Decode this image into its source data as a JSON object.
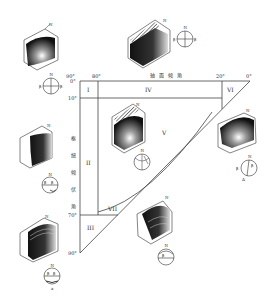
{
  "diagram": {
    "x_axis_title": "轴面倾角",
    "y_axis_title_chars": [
      "枢",
      "纽",
      "倾",
      "伏",
      "角"
    ],
    "x_ticks": [
      {
        "label": "90°",
        "value": 90
      },
      {
        "label": "80°",
        "value": 80
      },
      {
        "label": "20°",
        "value": 20
      },
      {
        "label": "0°",
        "value": 0
      }
    ],
    "y_ticks": [
      {
        "label": "0°",
        "value": 0
      },
      {
        "label": "10°",
        "value": 10
      },
      {
        "label": "70°",
        "value": 70
      },
      {
        "label": "90°",
        "value": 90
      }
    ],
    "regions": [
      {
        "id": "I",
        "label": "I"
      },
      {
        "id": "II",
        "label": "II"
      },
      {
        "id": "III",
        "label": "III"
      },
      {
        "id": "IV",
        "label": "IV"
      },
      {
        "id": "V",
        "label": "V"
      },
      {
        "id": "VI",
        "label": "VI"
      },
      {
        "id": "VII",
        "label": "VII"
      }
    ],
    "fold_blocks": [
      {
        "position": "top-left",
        "north_label": "N",
        "stereonet_labels": [
          "N",
          "β",
          "β"
        ]
      },
      {
        "position": "top-center",
        "north_label": "N",
        "stereonet_labels": [
          "N",
          "β",
          "β"
        ]
      },
      {
        "position": "center-region-V",
        "north_label": "N",
        "stereonet_labels": [
          "N"
        ]
      },
      {
        "position": "middle-left",
        "north_label": "N",
        "stereonet_labels": [
          "N",
          "β",
          "β"
        ]
      },
      {
        "position": "middle-right",
        "north_label": "N",
        "stereonet_labels": [
          "N",
          "β",
          "β",
          "A"
        ]
      },
      {
        "position": "bottom-left",
        "north_label": "N",
        "stereonet_labels": [
          "N",
          "β",
          "β",
          "a"
        ]
      },
      {
        "position": "bottom-center",
        "north_label": "N",
        "stereonet_labels": [
          "N",
          "β"
        ]
      }
    ],
    "north": "N",
    "beta": "β",
    "axis_a": "A",
    "axis_a_lower": "a"
  }
}
